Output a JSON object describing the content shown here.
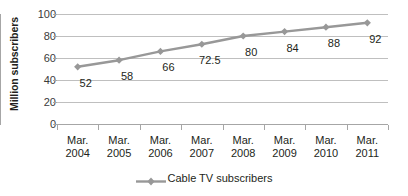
{
  "chart_data": {
    "type": "line",
    "title": "",
    "xlabel": "",
    "ylabel": "Million subscribers",
    "ylim": [
      0,
      100
    ],
    "yticks": [
      0,
      20,
      40,
      60,
      80,
      100
    ],
    "grid": true,
    "legend_position": "bottom-center",
    "categories": [
      {
        "line1": "Mar.",
        "line2": "2004"
      },
      {
        "line1": "Mar.",
        "line2": "2005"
      },
      {
        "line1": "Mar.",
        "line2": "2006"
      },
      {
        "line1": "Mar.",
        "line2": "2007"
      },
      {
        "line1": "Mar.",
        "line2": "2008"
      },
      {
        "line1": "Mar.",
        "line2": "2009"
      },
      {
        "line1": "Mar.",
        "line2": "2010"
      },
      {
        "line1": "Mar.",
        "line2": "2011"
      }
    ],
    "category_labels": [
      "Mar. 2004",
      "Mar. 2005",
      "Mar. 2006",
      "Mar. 2007",
      "Mar. 2008",
      "Mar. 2009",
      "Mar. 2010",
      "Mar. 2011"
    ],
    "series": [
      {
        "name": "Cable TV subscribers",
        "values": [
          52,
          58,
          66,
          72.5,
          80,
          84,
          88,
          92
        ],
        "value_labels": [
          "52",
          "58",
          "66",
          "72.5",
          "80",
          "84",
          "88",
          "92"
        ],
        "color": "#989898",
        "marker": "diamond"
      }
    ]
  },
  "axis": {
    "y_tick_labels": [
      "100",
      "80",
      "60",
      "40",
      "20",
      "0"
    ],
    "y_title": "Million subscribers"
  },
  "legend": {
    "entries": [
      {
        "label": "Cable TV subscribers",
        "color": "#989898",
        "marker": "diamond"
      }
    ]
  },
  "colors": {
    "series": "#989898",
    "gridline": "#bfbfbf",
    "axis": "#a6a6a6",
    "text": "#231f20",
    "background": "#ffffff"
  }
}
